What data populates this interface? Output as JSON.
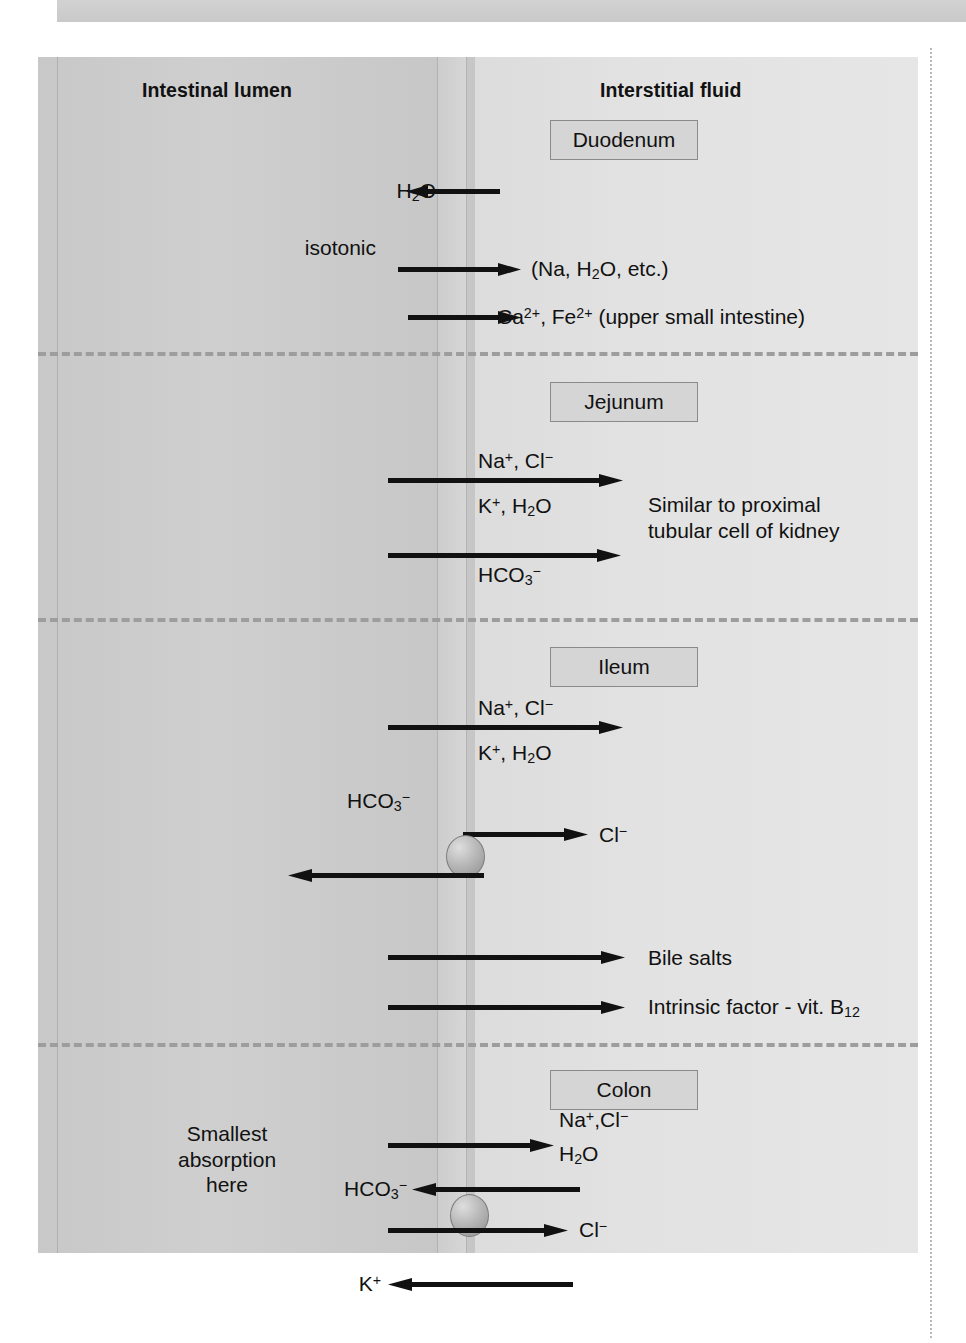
{
  "figure": {
    "type": "physiology-diagram",
    "columns": {
      "left_header": "Intestinal lumen",
      "right_header": "Interstitial fluid"
    },
    "colors": {
      "lumen_fill": "#c9c9c9",
      "interstitial_fill": "#e1e1e1",
      "membrane_fill": "#d2d2d2",
      "box_fill": "#d5d5d5",
      "box_border": "#8a8a8a",
      "arrow": "#111111",
      "divider": "#9d9d9d",
      "carrier": "#b9b9b9"
    },
    "sections": [
      {
        "id": "duodenum",
        "name": "Duodenum",
        "labels": [
          {
            "name": "h2o-label",
            "html": "H<sub>2</sub>O"
          },
          {
            "name": "isotonic-label",
            "html": "isotonic"
          },
          {
            "name": "na-h2o-etc-label",
            "html": "(Na, H<sub>2</sub>O, etc.)"
          },
          {
            "name": "ca-fe-label",
            "html": "Ca<sup>2+</sup>, Fe<sup>2+</sup> (upper small intestine)"
          }
        ],
        "arrows": [
          {
            "name": "h2o-arrow",
            "direction": "left"
          },
          {
            "name": "na-h2o-etc-arrow",
            "direction": "right"
          },
          {
            "name": "ca-fe-arrow",
            "direction": "right"
          }
        ]
      },
      {
        "id": "jejunum",
        "name": "Jejunum",
        "labels": [
          {
            "name": "na-cl-label",
            "html": "Na<sup>+</sup>, Cl<sup>&#8722;</sup>"
          },
          {
            "name": "k-h2o-label",
            "html": "K<sup>+</sup>, H<sub>2</sub>O"
          },
          {
            "name": "hco3-label",
            "html": "HCO<sub>3</sub><sup>&#8722;</sup>"
          },
          {
            "name": "kidney-note-label",
            "html": "Similar to proximal\ntubular cell of kidney"
          }
        ],
        "arrows": [
          {
            "name": "na-cl-k-h2o-arrow",
            "direction": "right"
          },
          {
            "name": "hco3-arrow",
            "direction": "right"
          }
        ]
      },
      {
        "id": "ileum",
        "name": "Ileum",
        "labels": [
          {
            "name": "na-cl-label",
            "html": "Na<sup>+</sup>, Cl<sup>&#8722;</sup>"
          },
          {
            "name": "k-h2o-label",
            "html": "K<sup>+</sup>, H<sub>2</sub>O"
          },
          {
            "name": "hco3-label",
            "html": "HCO<sub>3</sub><sup>&#8722;</sup>"
          },
          {
            "name": "cl-label",
            "html": "Cl<sup>&#8722;</sup>"
          },
          {
            "name": "bile-salts-label",
            "html": "Bile salts"
          },
          {
            "name": "intrinsic-factor-label",
            "html": "Intrinsic factor - vit. B<sub>12</sub>"
          }
        ],
        "arrows": [
          {
            "name": "na-cl-k-h2o-arrow",
            "direction": "right"
          },
          {
            "name": "cl-exchange-arrow",
            "direction": "right"
          },
          {
            "name": "hco3-exchange-arrow",
            "direction": "left"
          },
          {
            "name": "bile-salts-arrow",
            "direction": "right"
          },
          {
            "name": "intrinsic-factor-arrow",
            "direction": "right"
          }
        ],
        "carrier": {
          "name": "cl-hco3-exchanger"
        }
      },
      {
        "id": "colon",
        "name": "Colon",
        "labels": [
          {
            "name": "smallest-absorption-label",
            "html": "Smallest\nabsorption\nhere"
          },
          {
            "name": "na-cl-label",
            "html": "Na<sup>+</sup>,Cl<sup>&#8722;</sup>"
          },
          {
            "name": "h2o-label",
            "html": "H<sub>2</sub>O"
          },
          {
            "name": "hco3-label",
            "html": "HCO<sub>3</sub><sup>&#8722;</sup>"
          },
          {
            "name": "cl-label",
            "html": "Cl<sup>&#8722;</sup>"
          },
          {
            "name": "k-label",
            "html": "K<sup>+</sup>"
          }
        ],
        "arrows": [
          {
            "name": "na-cl-h2o-arrow",
            "direction": "right"
          },
          {
            "name": "hco3-arrow",
            "direction": "left"
          },
          {
            "name": "cl-arrow",
            "direction": "right"
          },
          {
            "name": "k-arrow",
            "direction": "left"
          }
        ],
        "carrier": {
          "name": "cl-hco3-exchanger"
        }
      }
    ]
  }
}
